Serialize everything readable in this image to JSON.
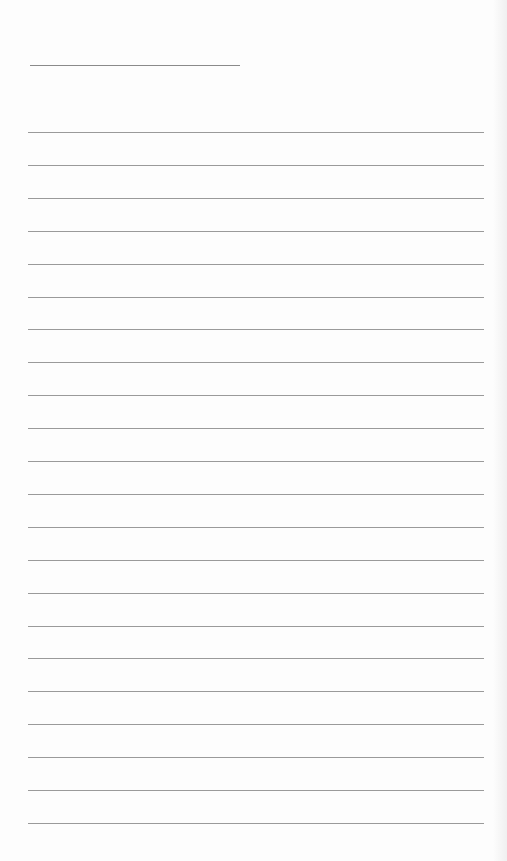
{
  "document": {
    "type": "blank ruled sheet",
    "header_line": {
      "left": 30,
      "top": 65,
      "width": 210
    },
    "rules": {
      "count": 22,
      "first_top": 132,
      "spacing": 32.9,
      "left": 28,
      "width": 456
    },
    "colors": {
      "paper": "#fdfdfd",
      "line": "#9a9a9a"
    }
  }
}
